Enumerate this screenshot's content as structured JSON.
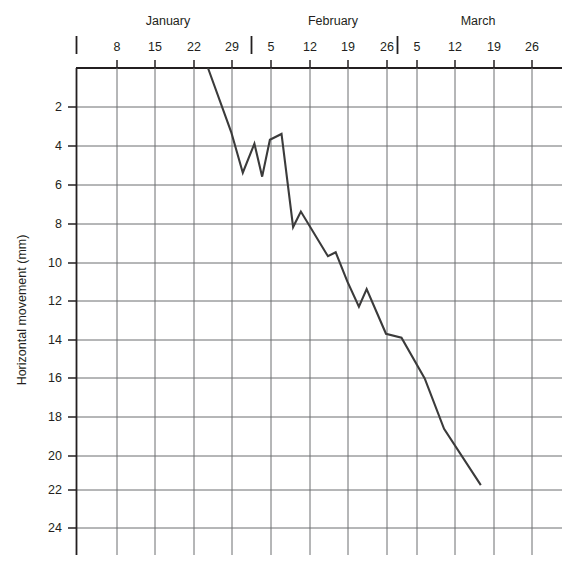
{
  "chart_data": {
    "type": "line",
    "title": "",
    "xlabel": "",
    "ylabel": "Horizontal movement (mm)",
    "ylim": [
      0,
      25
    ],
    "y_inverted": true,
    "grid": true,
    "legend": null,
    "x_axis": {
      "months": [
        "January",
        "February",
        "March"
      ],
      "tick_labels": [
        "",
        "8",
        "15",
        "22",
        "29",
        "5",
        "12",
        "19",
        "26",
        "5",
        "12",
        "19",
        "26"
      ],
      "month_separators": [
        "between 29 and 5",
        "between 26 and 5"
      ],
      "unit": "week"
    },
    "y_axis": {
      "tick_labels": [
        "2",
        "4",
        "6",
        "8",
        "10",
        "12",
        "14",
        "16",
        "18",
        "20",
        "22",
        "24"
      ],
      "tick_values": [
        2,
        4,
        6,
        8,
        10,
        12,
        14,
        16,
        18,
        20,
        22,
        24
      ]
    },
    "series": [
      {
        "name": "Horizontal movement",
        "color": "#3b3b3b",
        "points": [
          {
            "x": "Jan 26",
            "week_index": 3.4,
            "y": 0.0
          },
          {
            "x": "Jan 29",
            "week_index": 4.0,
            "y": 3.3
          },
          {
            "x": "Jan 31",
            "week_index": 4.3,
            "y": 5.4
          },
          {
            "x": "Feb 2",
            "week_index": 4.6,
            "y": 3.9
          },
          {
            "x": "Feb 3",
            "week_index": 4.8,
            "y": 5.6
          },
          {
            "x": "Feb 5",
            "week_index": 5.0,
            "y": 3.7
          },
          {
            "x": "Feb 7",
            "week_index": 5.3,
            "y": 3.4
          },
          {
            "x": "Feb 9",
            "week_index": 5.6,
            "y": 8.2
          },
          {
            "x": "Feb 10",
            "week_index": 5.8,
            "y": 7.4
          },
          {
            "x": "Feb 15",
            "week_index": 6.5,
            "y": 9.7
          },
          {
            "x": "Feb 16",
            "week_index": 6.7,
            "y": 9.5
          },
          {
            "x": "Feb 19",
            "week_index": 7.0,
            "y": 11.0
          },
          {
            "x": "Feb 21",
            "week_index": 7.3,
            "y": 12.3
          },
          {
            "x": "Feb 23",
            "week_index": 7.5,
            "y": 11.4
          },
          {
            "x": "Feb 26",
            "week_index": 8.0,
            "y": 13.7
          },
          {
            "x": "Mar 1",
            "week_index": 8.4,
            "y": 13.9
          },
          {
            "x": "Mar 5",
            "week_index": 9.0,
            "y": 16.0
          },
          {
            "x": "Mar 9",
            "week_index": 9.5,
            "y": 18.6
          },
          {
            "x": "Mar 14",
            "week_index": 10.45,
            "y": 21.5
          }
        ]
      }
    ]
  },
  "labels": {
    "y_axis_title": "Horizontal movement (mm)",
    "months": [
      {
        "name": "January"
      },
      {
        "name": "February"
      },
      {
        "name": "March"
      }
    ],
    "x_ticks": [
      {
        "text": ""
      },
      {
        "text": "8"
      },
      {
        "text": "15"
      },
      {
        "text": "22"
      },
      {
        "text": "29"
      },
      {
        "text": "5"
      },
      {
        "text": "12"
      },
      {
        "text": "19"
      },
      {
        "text": "26"
      },
      {
        "text": "5"
      },
      {
        "text": "12"
      },
      {
        "text": "19"
      },
      {
        "text": "26"
      }
    ],
    "y_ticks": [
      {
        "text": "2"
      },
      {
        "text": "4"
      },
      {
        "text": "6"
      },
      {
        "text": "8"
      },
      {
        "text": "10"
      },
      {
        "text": "12"
      },
      {
        "text": "14"
      },
      {
        "text": "16"
      },
      {
        "text": "18"
      },
      {
        "text": "20"
      },
      {
        "text": "22"
      },
      {
        "text": "24"
      }
    ]
  }
}
